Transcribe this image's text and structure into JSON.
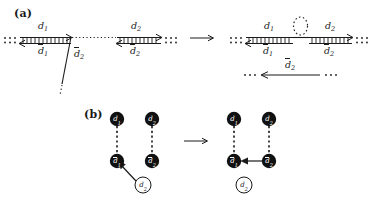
{
  "figure": {
    "panels": [
      {
        "id": "a",
        "label": "(a)",
        "transition_arrow": "→",
        "left_diagram": {
          "ellipsis_left": "· · ·",
          "ellipsis_right": "· · ·",
          "segments": [
            {
              "name": "segment-d1",
              "top_label": "d",
              "top_sub": "1",
              "bottom_label": "d",
              "bottom_sub": "1",
              "bottom_overline": true,
              "top_overline": false
            },
            {
              "name": "segment-d2",
              "top_label": "d",
              "top_sub": "2",
              "bottom_label": "d",
              "bottom_sub": "2",
              "bottom_overline": true,
              "top_overline": false
            }
          ],
          "branch": {
            "label": "d",
            "sub": "2",
            "overline": true,
            "ellipsis": "⋮"
          }
        },
        "right_diagram": {
          "ellipsis_left": "· · ·",
          "ellipsis_right": "· · ·",
          "segments": [
            {
              "name": "segment-d1",
              "top_label": "d",
              "top_sub": "1",
              "bottom_label": "d",
              "bottom_sub": "1",
              "bottom_overline": true
            },
            {
              "name": "segment-d2",
              "top_label": "d",
              "top_sub": "2",
              "bottom_label": "d",
              "bottom_sub": "2",
              "bottom_overline": true
            }
          ],
          "loop": {
            "name": "dotted-loop",
            "style": "dotted"
          },
          "lower_line": {
            "label": "d",
            "sub": "2",
            "overline": true,
            "ellipsis_left": "· · ·",
            "ellipsis_right": "· · ·",
            "arrow_direction": "left"
          }
        }
      },
      {
        "id": "b",
        "label": "(b)",
        "transition_arrow": "→",
        "left_graph": {
          "nodes": [
            {
              "name": "node-d1-top",
              "label": "d",
              "sub": "1",
              "overline": false,
              "filled": true
            },
            {
              "name": "node-d2-top",
              "label": "d",
              "sub": "2",
              "overline": false,
              "filled": true
            },
            {
              "name": "node-d1-bottom",
              "label": "d",
              "sub": "1",
              "overline": true,
              "filled": true
            },
            {
              "name": "node-d2-bottom",
              "label": "d",
              "sub": "2",
              "overline": true,
              "filled": true
            },
            {
              "name": "node-d2-open",
              "label": "d",
              "sub": "2",
              "overline": false,
              "filled": false
            }
          ],
          "edges": [
            {
              "name": "edge-d1-dashed",
              "style": "dashed",
              "from": "node-d1-top",
              "to": "node-d1-bottom"
            },
            {
              "name": "edge-d2-dashed",
              "style": "dashed",
              "from": "node-d2-top",
              "to": "node-d2-bottom"
            },
            {
              "name": "edge-open-to-d1bar",
              "style": "solid-arrow",
              "from": "node-d2-open",
              "to": "node-d1-bottom"
            }
          ]
        },
        "right_graph": {
          "nodes": [
            {
              "name": "node-d1-top",
              "label": "d",
              "sub": "1",
              "overline": false,
              "filled": true
            },
            {
              "name": "node-d2-top",
              "label": "d",
              "sub": "2",
              "overline": false,
              "filled": true
            },
            {
              "name": "node-d1-bottom",
              "label": "d",
              "sub": "1",
              "overline": true,
              "filled": true
            },
            {
              "name": "node-d2-bottom",
              "label": "d",
              "sub": "2",
              "overline": true,
              "filled": true
            },
            {
              "name": "node-d2-open",
              "label": "d",
              "sub": "2",
              "overline": false,
              "filled": false
            }
          ],
          "edges": [
            {
              "name": "edge-d1-dashed",
              "style": "dashed",
              "from": "node-d1-top",
              "to": "node-d1-bottom"
            },
            {
              "name": "edge-d2-dashed",
              "style": "dashed",
              "from": "node-d2-top",
              "to": "node-d2-bottom"
            },
            {
              "name": "edge-d2bar-to-d1bar",
              "style": "solid-arrow",
              "from": "node-d2-bottom",
              "to": "node-d1-bottom"
            }
          ]
        }
      }
    ]
  },
  "colors": {
    "ink": "#1a1a1a",
    "node_fill": "#111111",
    "node_label": "#ffffff",
    "background": "#ffffff"
  }
}
